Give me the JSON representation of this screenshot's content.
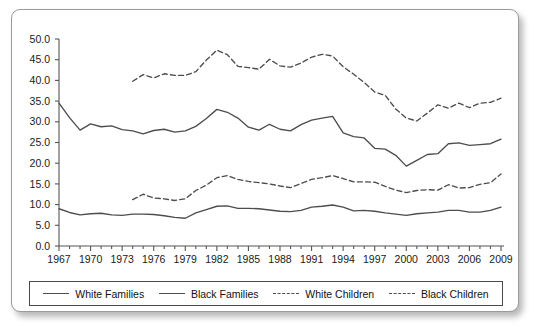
{
  "chart_data": {
    "type": "line",
    "title": "",
    "subtitle": "",
    "xlabel": "",
    "ylabel": "",
    "xlim": [
      1967,
      2009
    ],
    "ylim": [
      0.0,
      50.0
    ],
    "grid": false,
    "legend_position": "bottom",
    "x_tick_labels": [
      "1967",
      "1970",
      "1973",
      "1976",
      "1979",
      "1982",
      "1985",
      "1988",
      "1991",
      "1994",
      "1997",
      "2000",
      "2003",
      "2006",
      "2009"
    ],
    "x_tick_values": [
      1967,
      1970,
      1973,
      1976,
      1979,
      1982,
      1985,
      1988,
      1991,
      1994,
      1997,
      2000,
      2003,
      2006,
      2009
    ],
    "y_tick_labels": [
      "0.0",
      "5.0",
      "10.0",
      "15.0",
      "20.0",
      "25.0",
      "30.0",
      "35.0",
      "40.0",
      "45.0",
      "50.0"
    ],
    "y_tick_values": [
      0.0,
      5.0,
      10.0,
      15.0,
      20.0,
      25.0,
      30.0,
      35.0,
      40.0,
      45.0,
      50.0
    ],
    "x": [
      1967,
      1968,
      1969,
      1970,
      1971,
      1972,
      1973,
      1974,
      1975,
      1976,
      1977,
      1978,
      1979,
      1980,
      1981,
      1982,
      1983,
      1984,
      1985,
      1986,
      1987,
      1988,
      1989,
      1990,
      1991,
      1992,
      1993,
      1994,
      1995,
      1996,
      1997,
      1998,
      1999,
      2000,
      2001,
      2002,
      2003,
      2004,
      2005,
      2006,
      2007,
      2008,
      2009
    ],
    "series": [
      {
        "name": "White Families",
        "style": "solid",
        "color": "#4d4d4d",
        "values": [
          9.0,
          8.1,
          7.5,
          7.8,
          7.9,
          7.5,
          7.4,
          7.7,
          7.7,
          7.6,
          7.3,
          6.9,
          6.7,
          8.0,
          8.8,
          9.6,
          9.7,
          9.1,
          9.1,
          9.0,
          8.7,
          8.4,
          8.3,
          8.6,
          9.4,
          9.6,
          9.9,
          9.4,
          8.5,
          8.6,
          8.4,
          8.0,
          7.7,
          7.4,
          7.8,
          8.0,
          8.2,
          8.6,
          8.6,
          8.2,
          8.2,
          8.6,
          9.4
        ],
        "value_label_range": "7 to 10"
      },
      {
        "name": "Black Families",
        "style": "solid",
        "color": "#4d4d4d",
        "values": [
          34.5,
          31.0,
          28.0,
          29.5,
          28.8,
          29.0,
          28.1,
          27.8,
          27.1,
          27.9,
          28.2,
          27.5,
          27.8,
          28.9,
          30.8,
          33.0,
          32.3,
          30.9,
          28.7,
          28.0,
          29.4,
          28.2,
          27.8,
          29.3,
          30.4,
          30.9,
          31.3,
          27.3,
          26.4,
          26.1,
          23.6,
          23.4,
          21.9,
          19.3,
          20.7,
          22.1,
          22.3,
          24.7,
          24.9,
          24.3,
          24.5,
          24.7,
          25.8
        ],
        "value_label_range": "19 to 35"
      },
      {
        "name": "White Children",
        "style": "dashed",
        "color": "#4d4d4d",
        "values": [
          null,
          null,
          null,
          null,
          null,
          null,
          null,
          11.2,
          12.5,
          11.6,
          11.4,
          11.0,
          11.4,
          13.4,
          14.7,
          16.5,
          17.0,
          16.1,
          15.6,
          15.3,
          15.0,
          14.5,
          14.1,
          15.1,
          16.1,
          16.5,
          17.0,
          16.3,
          15.5,
          15.5,
          15.4,
          14.4,
          13.5,
          12.9,
          13.4,
          13.6,
          13.5,
          14.8,
          14.0,
          14.1,
          14.9,
          15.3,
          17.4
        ],
        "value_label_range": "11 to 18"
      },
      {
        "name": "Black Children",
        "style": "dashed",
        "color": "#4d4d4d",
        "values": [
          null,
          null,
          null,
          null,
          null,
          null,
          null,
          39.8,
          41.4,
          40.6,
          41.6,
          41.2,
          41.2,
          42.1,
          44.9,
          47.3,
          46.2,
          43.4,
          43.1,
          42.7,
          45.1,
          43.5,
          43.2,
          44.2,
          45.6,
          46.3,
          45.9,
          43.3,
          41.5,
          39.5,
          37.2,
          36.4,
          33.1,
          30.9,
          30.2,
          32.1,
          34.1,
          33.3,
          34.5,
          33.4,
          34.5,
          34.7,
          35.7
        ],
        "value_label_range": "30 to 48"
      }
    ]
  },
  "legend": {
    "entries": [
      {
        "label": "White Families",
        "style": "solid"
      },
      {
        "label": "Black Families",
        "style": "solid"
      },
      {
        "label": "White Children",
        "style": "dashed"
      },
      {
        "label": "Black Children",
        "style": "dashed"
      }
    ]
  }
}
